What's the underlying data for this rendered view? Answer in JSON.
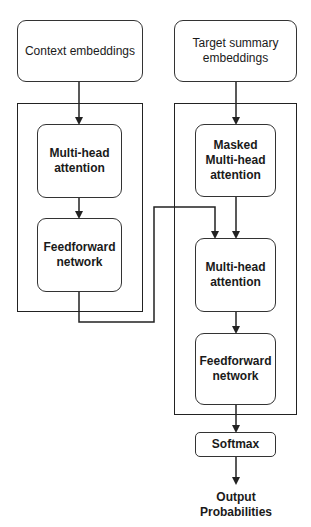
{
  "encoder": {
    "input": "Context embeddings",
    "blocks": [
      "Multi-head attention",
      "Feedforward network"
    ]
  },
  "decoder": {
    "input": "Target summary embeddings",
    "blocks": [
      "Masked Multi-head attention",
      "Multi-head attention",
      "Feedforward network"
    ]
  },
  "head": {
    "softmax": "Softmax",
    "output_line1": "Output",
    "output_line2": "Probabilities"
  },
  "colors": {
    "stroke": "#333333",
    "background": "#ffffff",
    "text": "#1a1a1a"
  }
}
